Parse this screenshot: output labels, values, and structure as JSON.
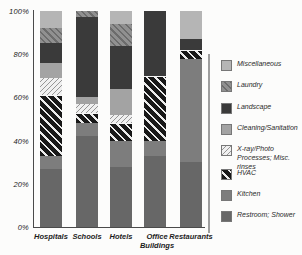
{
  "chart_data": {
    "type": "bar",
    "stacked": true,
    "percent": true,
    "xlabel": "",
    "ylabel": "",
    "ylim": [
      0,
      100
    ],
    "grid": false,
    "legend_position": "right",
    "y_tick_values": [
      100,
      80,
      60,
      40,
      20,
      0
    ],
    "y_tick_labels": [
      "100%",
      "80%",
      "60%",
      "40%",
      "20%",
      "0%"
    ],
    "categories": [
      "Hospitals",
      "Schools",
      "Hotels",
      "Office Buildings",
      "Restaurants"
    ],
    "series": [
      {
        "key": "restroom",
        "name": "Restroom; Shower",
        "pattern": "solid",
        "color": "#676767",
        "values": [
          27,
          42,
          28,
          33,
          30
        ]
      },
      {
        "key": "kitchen",
        "name": "Kitchen",
        "pattern": "solid",
        "color": "#7d7d7d",
        "values": [
          6,
          6,
          12,
          7,
          48
        ]
      },
      {
        "key": "hvac",
        "name": "HVAC",
        "pattern": "hatch-bold-dark",
        "color": "#181818",
        "stripe": "#ececec",
        "values": [
          28,
          5,
          8,
          30,
          4
        ]
      },
      {
        "key": "xray",
        "name": "X-ray/Photo Processes; Misc. rinses",
        "pattern": "hatch-fine-light",
        "color": "#f0f0f0",
        "stripe": "#969696",
        "values": [
          8,
          4,
          4,
          0,
          0
        ]
      },
      {
        "key": "cleaning",
        "name": "Cleaning/Sanitation",
        "pattern": "solid",
        "color": "#a3a3a3",
        "values": [
          7,
          3,
          12,
          0,
          0
        ]
      },
      {
        "key": "landscape",
        "name": "Landscape",
        "pattern": "solid",
        "color": "#3a3a3a",
        "values": [
          9,
          37,
          20,
          30,
          5
        ]
      },
      {
        "key": "laundry",
        "name": "Laundry",
        "pattern": "hatch-fine-gray",
        "color": "#909090",
        "stripe": "#6c6c6c",
        "values": [
          7,
          3,
          10,
          0,
          0
        ]
      },
      {
        "key": "miscellaneous",
        "name": "Miscellaneous",
        "pattern": "solid",
        "color": "#b5b5b5",
        "values": [
          8,
          0,
          6,
          0,
          13
        ]
      }
    ],
    "legend_order": [
      "miscellaneous",
      "laundry",
      "landscape",
      "cleaning",
      "xray",
      "hvac",
      "kitchen",
      "restroom"
    ]
  }
}
